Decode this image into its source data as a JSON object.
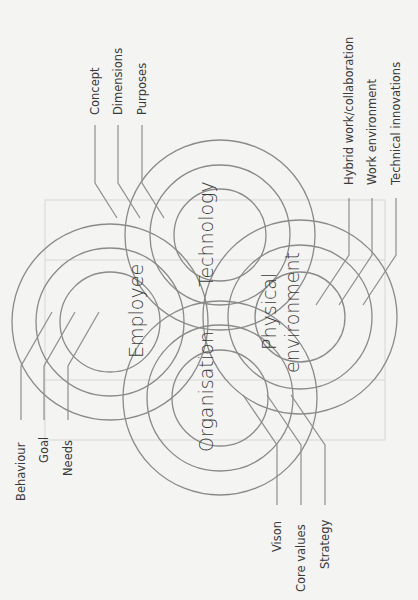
{
  "diagram": {
    "colors": {
      "background": "#f4f4f2",
      "ring": "#8a8a8a",
      "text": "#3a3a3a"
    },
    "clusters": {
      "employee": {
        "label": "Employee",
        "aspects": [
          "Behaviour",
          "Goal",
          "Needs"
        ]
      },
      "technology": {
        "label": "Technology",
        "aspects": [
          "Concept",
          "Dimensions",
          "Purposes"
        ]
      },
      "organisation": {
        "label": "Organisation",
        "aspects": [
          "Vison",
          "Core values",
          "Strategy"
        ]
      },
      "physical_environment": {
        "label_line1": "Physical",
        "label_line2": "environment",
        "aspects": [
          "Hybrid work/collaboration",
          "Work environment",
          "Technical innovations"
        ]
      }
    }
  }
}
